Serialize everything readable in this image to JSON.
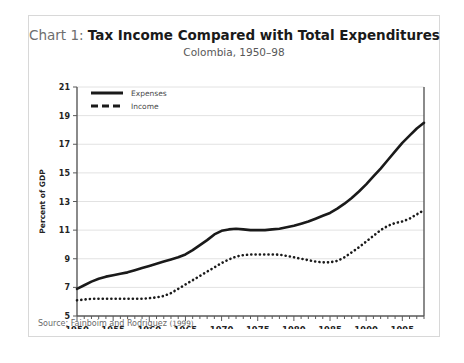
{
  "card": {
    "title_prefix": "Chart 1: ",
    "title_main": "Tax Income Compared with Total Expenditures",
    "subtitle": "Colombia, 1950–98",
    "source_label": "Source: Fainboim and Rodriguez ",
    "source_year": "(1999)"
  },
  "chart_data": {
    "type": "line",
    "title": "Chart 1: Tax Income Compared with Total Expenditures",
    "subtitle": "Colombia, 1950–98",
    "xlabel": "",
    "ylabel": "Percent of GDP",
    "xlim": [
      1950,
      1998
    ],
    "ylim": [
      5,
      21
    ],
    "yticks": [
      5,
      7,
      9,
      11,
      13,
      15,
      17,
      19,
      21
    ],
    "ytick_labels": [
      "5",
      "7",
      "9",
      "11",
      "13",
      "15",
      "17",
      "19",
      "21"
    ],
    "xticks": [
      1950,
      1955,
      1960,
      1965,
      1970,
      1975,
      1980,
      1985,
      1990,
      1995
    ],
    "xtick_labels": [
      "1950",
      "1955",
      "1960",
      "1965",
      "1970",
      "1975",
      "1980",
      "1985",
      "1990",
      "1995"
    ],
    "minor_xtick_interval": 1,
    "grid": "horizontal",
    "legend_position": "top-left",
    "x": [
      1950,
      1951,
      1952,
      1953,
      1954,
      1955,
      1956,
      1957,
      1958,
      1959,
      1960,
      1961,
      1962,
      1963,
      1964,
      1965,
      1966,
      1967,
      1968,
      1969,
      1970,
      1971,
      1972,
      1973,
      1974,
      1975,
      1976,
      1977,
      1978,
      1979,
      1980,
      1981,
      1982,
      1983,
      1984,
      1985,
      1986,
      1987,
      1988,
      1989,
      1990,
      1991,
      1992,
      1993,
      1994,
      1995,
      1996,
      1997,
      1998
    ],
    "series": [
      {
        "name": "Expenses",
        "style": "solid",
        "color": "#1a1a1a",
        "values": [
          6.9,
          7.15,
          7.4,
          7.6,
          7.75,
          7.85,
          7.95,
          8.05,
          8.2,
          8.35,
          8.5,
          8.65,
          8.8,
          8.95,
          9.1,
          9.3,
          9.6,
          9.95,
          10.3,
          10.7,
          10.95,
          11.05,
          11.1,
          11.05,
          11.0,
          11.0,
          11.0,
          11.05,
          11.1,
          11.2,
          11.3,
          11.45,
          11.6,
          11.8,
          12.0,
          12.2,
          12.5,
          12.85,
          13.25,
          13.7,
          14.2,
          14.75,
          15.3,
          15.9,
          16.5,
          17.1,
          17.6,
          18.1,
          18.5
        ]
      },
      {
        "name": "Income",
        "style": "dotted",
        "color": "#1a1a1a",
        "values": [
          6.1,
          6.15,
          6.2,
          6.2,
          6.2,
          6.2,
          6.2,
          6.2,
          6.2,
          6.2,
          6.25,
          6.3,
          6.4,
          6.6,
          6.9,
          7.2,
          7.5,
          7.8,
          8.1,
          8.4,
          8.7,
          8.95,
          9.15,
          9.25,
          9.3,
          9.3,
          9.3,
          9.3,
          9.28,
          9.2,
          9.1,
          9.0,
          8.9,
          8.8,
          8.75,
          8.75,
          8.85,
          9.1,
          9.45,
          9.8,
          10.2,
          10.6,
          11.0,
          11.3,
          11.5,
          11.6,
          11.8,
          12.1,
          12.4
        ]
      }
    ]
  }
}
